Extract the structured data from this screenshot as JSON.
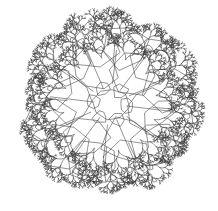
{
  "figure": {
    "kind": "recursive-branching-graph",
    "background_color": "#ffffff",
    "stroke_color": "#3b3b3b",
    "stroke_width": 0.55,
    "canvas": {
      "width": 218,
      "height": 211
    },
    "center": {
      "x": 110,
      "y": 104
    },
    "outer_radius": 94,
    "symmetry_order": 6,
    "branch_depth": 7,
    "branch_angle_deg": 27,
    "branch_scale": 0.69,
    "core_ring_radius": 17,
    "cell_rings": [
      {
        "radius": 17,
        "count": 6,
        "cell_scale": 0.42
      },
      {
        "radius": 40,
        "count": 6,
        "cell_scale": 0.58
      },
      {
        "radius": 62,
        "count": 12,
        "cell_scale": 0.4
      }
    ],
    "trunk_start_radius": 17,
    "trunk_end_radius": 60,
    "tip_cluster_density": 3
  }
}
